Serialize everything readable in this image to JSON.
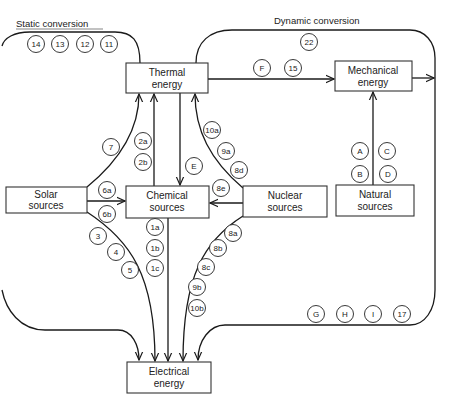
{
  "headers": {
    "static": "Static conversion",
    "dynamic": "Dynamic conversion"
  },
  "boxes": {
    "thermal": [
      "Thermal",
      "energy"
    ],
    "mechanical": [
      "Mechanical",
      "energy"
    ],
    "solar": [
      "Solar",
      "sources"
    ],
    "chemical": [
      "Chemical",
      "sources"
    ],
    "nuclear": [
      "Nuclear",
      "sources"
    ],
    "natural": [
      "Natural",
      "sources"
    ],
    "electrical": [
      "Electrical",
      "energy"
    ]
  },
  "labels": {
    "static_path": [
      "14",
      "13",
      "12",
      "11"
    ],
    "dynamic_top": "22",
    "thermal_to_mech": [
      "F",
      "15"
    ],
    "natural_to_mech": [
      "A",
      "C",
      "B",
      "D"
    ],
    "solar_to_thermal": "7",
    "chem_to_thermal": [
      "2a",
      "2b"
    ],
    "thermal_to_chem": "E",
    "nuclear_to_thermal": [
      "10a",
      "9a",
      "8d"
    ],
    "nuclear_to_chem": "8e",
    "solar_to_chem": [
      "6a",
      "6b"
    ],
    "solar_to_elec": [
      "3",
      "4",
      "5"
    ],
    "chem_to_elec": [
      "1a",
      "1b",
      "1c"
    ],
    "nuclear_to_elec": [
      "8a",
      "8b",
      "8c",
      "9b",
      "10b"
    ],
    "mech_to_elec": [
      "G",
      "H",
      "I",
      "17"
    ]
  }
}
